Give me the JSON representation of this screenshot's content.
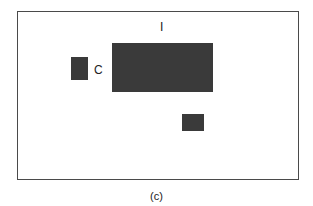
{
  "diagram": {
    "frame": {
      "border_color": "#4a4a4a"
    },
    "blocks": [
      {
        "id": "C",
        "label": "C",
        "color": "#3a3a3a"
      },
      {
        "id": "I",
        "label": "I",
        "color": "#3a3a3a"
      },
      {
        "id": "unlabeled",
        "label": "",
        "color": "#3a3a3a"
      }
    ],
    "labels": {
      "c": "C",
      "i": "I"
    },
    "caption": "(c)"
  }
}
